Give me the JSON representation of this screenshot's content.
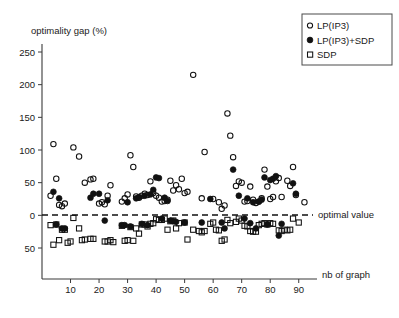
{
  "chart_data": {
    "type": "scatter",
    "title": "",
    "xlabel": "nb of graph",
    "ylabel": "optimality gap (%)",
    "xlim": [
      0,
      95
    ],
    "ylim": [
      -62,
      262
    ],
    "xticks": [
      10,
      20,
      30,
      40,
      50,
      60,
      70,
      80,
      90
    ],
    "xtick_labels": [
      "10",
      "20",
      "30",
      "40",
      "50",
      "60",
      "70",
      "80",
      "90"
    ],
    "yticks": [
      250,
      200,
      150,
      100,
      50,
      0,
      -50
    ],
    "ytick_labels": [
      "250",
      "200",
      "150",
      "100",
      "50",
      "0",
      "50"
    ],
    "grid": false,
    "legend_position": "top-right",
    "annotations": [
      {
        "name": "optimal-value",
        "text": "optimal value",
        "y": 0,
        "style": "dashed-horizontal-line"
      }
    ],
    "series": [
      {
        "name": "LP(IP3)",
        "marker": "open-circle",
        "color": "#111111",
        "points": [
          [
            3,
            30
          ],
          [
            4,
            109
          ],
          [
            5,
            56
          ],
          [
            6,
            16
          ],
          [
            7,
            14
          ],
          [
            8,
            18
          ],
          [
            11,
            104
          ],
          [
            13,
            90
          ],
          [
            15,
            50
          ],
          [
            17,
            55
          ],
          [
            18,
            56
          ],
          [
            20,
            18
          ],
          [
            21,
            20
          ],
          [
            22,
            17
          ],
          [
            23,
            30
          ],
          [
            24,
            46
          ],
          [
            28,
            21
          ],
          [
            29,
            26
          ],
          [
            30,
            32
          ],
          [
            31,
            92
          ],
          [
            32,
            74
          ],
          [
            33,
            29
          ],
          [
            34,
            27
          ],
          [
            35,
            30
          ],
          [
            36,
            33
          ],
          [
            37,
            31
          ],
          [
            38,
            52
          ],
          [
            39,
            34
          ],
          [
            40,
            30
          ],
          [
            41,
            27
          ],
          [
            42,
            21
          ],
          [
            43,
            22
          ],
          [
            44,
            24
          ],
          [
            45,
            53
          ],
          [
            46,
            38
          ],
          [
            47,
            46
          ],
          [
            48,
            40
          ],
          [
            49,
            56
          ],
          [
            50,
            34
          ],
          [
            51,
            36
          ],
          [
            53,
            215
          ],
          [
            56,
            26
          ],
          [
            57,
            97
          ],
          [
            60,
            25
          ],
          [
            62,
            20
          ],
          [
            63,
            10
          ],
          [
            64,
            15
          ],
          [
            65,
            156
          ],
          [
            66,
            122
          ],
          [
            67,
            89
          ],
          [
            68,
            45
          ],
          [
            69,
            52
          ],
          [
            70,
            50
          ],
          [
            71,
            21
          ],
          [
            72,
            22
          ],
          [
            73,
            44
          ],
          [
            74,
            24
          ],
          [
            75,
            19
          ],
          [
            76,
            21
          ],
          [
            77,
            26
          ],
          [
            78,
            70
          ],
          [
            79,
            44
          ],
          [
            80,
            25
          ],
          [
            81,
            28
          ],
          [
            82,
            52
          ],
          [
            83,
            57
          ],
          [
            84,
            28
          ],
          [
            86,
            53
          ],
          [
            87,
            45
          ],
          [
            88,
            74
          ],
          [
            89,
            31
          ],
          [
            92,
            20
          ]
        ]
      },
      {
        "name": "LP(IP3)+SDP",
        "marker": "filled-circle",
        "color": "#111111",
        "points": [
          [
            4,
            36
          ],
          [
            5,
            -14
          ],
          [
            6,
            26
          ],
          [
            7,
            -20
          ],
          [
            8,
            -20
          ],
          [
            17,
            27
          ],
          [
            18,
            33
          ],
          [
            20,
            33
          ],
          [
            22,
            -8
          ],
          [
            23,
            23
          ],
          [
            28,
            -15
          ],
          [
            29,
            -15
          ],
          [
            30,
            20
          ],
          [
            31,
            -17
          ],
          [
            33,
            26
          ],
          [
            34,
            28
          ],
          [
            35,
            -13
          ],
          [
            36,
            30
          ],
          [
            37,
            -15
          ],
          [
            38,
            32
          ],
          [
            39,
            39
          ],
          [
            40,
            58
          ],
          [
            41,
            57
          ],
          [
            42,
            -5
          ],
          [
            43,
            27
          ],
          [
            44,
            22
          ],
          [
            45,
            -8
          ],
          [
            46,
            -9
          ],
          [
            47,
            -10
          ],
          [
            50,
            -11
          ],
          [
            56,
            -11
          ],
          [
            59,
            25
          ],
          [
            63,
            -11
          ],
          [
            64,
            -20
          ],
          [
            67,
            70
          ],
          [
            69,
            30
          ],
          [
            71,
            -5
          ],
          [
            72,
            26
          ],
          [
            73,
            -12
          ],
          [
            74,
            20
          ],
          [
            75,
            -20
          ],
          [
            76,
            21
          ],
          [
            77,
            24
          ],
          [
            78,
            58
          ],
          [
            79,
            -14
          ],
          [
            80,
            54
          ],
          [
            81,
            56
          ],
          [
            82,
            60
          ],
          [
            83,
            -31
          ],
          [
            84,
            -13
          ],
          [
            88,
            49
          ],
          [
            89,
            33
          ]
        ]
      },
      {
        "name": "SDP",
        "marker": "open-square",
        "color": "#111111",
        "points": [
          [
            3,
            -15
          ],
          [
            4,
            -45
          ],
          [
            5,
            -14
          ],
          [
            6,
            -38
          ],
          [
            7,
            -22
          ],
          [
            8,
            -22
          ],
          [
            9,
            -42
          ],
          [
            10,
            -40
          ],
          [
            11,
            -4
          ],
          [
            13,
            -20
          ],
          [
            14,
            -38
          ],
          [
            15,
            -37
          ],
          [
            17,
            -36
          ],
          [
            18,
            -36
          ],
          [
            22,
            -40
          ],
          [
            23,
            -40
          ],
          [
            24,
            -38
          ],
          [
            25,
            -41
          ],
          [
            28,
            -16
          ],
          [
            29,
            -39
          ],
          [
            30,
            -38
          ],
          [
            31,
            -18
          ],
          [
            32,
            -39
          ],
          [
            33,
            -20
          ],
          [
            34,
            -28
          ],
          [
            35,
            -14
          ],
          [
            36,
            -14
          ],
          [
            37,
            -17
          ],
          [
            38,
            -13
          ],
          [
            39,
            -12
          ],
          [
            40,
            -6
          ],
          [
            41,
            -7
          ],
          [
            42,
            -7
          ],
          [
            43,
            -5
          ],
          [
            44,
            -22
          ],
          [
            45,
            -9
          ],
          [
            46,
            -8
          ],
          [
            47,
            -20
          ],
          [
            48,
            -12
          ],
          [
            50,
            -11
          ],
          [
            51,
            -37
          ],
          [
            53,
            -22
          ],
          [
            55,
            -24
          ],
          [
            56,
            -26
          ],
          [
            57,
            -24
          ],
          [
            59,
            -13
          ],
          [
            60,
            -11
          ],
          [
            61,
            -22
          ],
          [
            62,
            -23
          ],
          [
            63,
            -39
          ],
          [
            64,
            -37
          ],
          [
            65,
            -7
          ],
          [
            66,
            -12
          ],
          [
            68,
            -10
          ],
          [
            69,
            -5
          ],
          [
            70,
            -8
          ],
          [
            71,
            -16
          ],
          [
            72,
            -17
          ],
          [
            73,
            -24
          ],
          [
            74,
            -25
          ],
          [
            75,
            -25
          ],
          [
            76,
            -15
          ],
          [
            77,
            -13
          ],
          [
            78,
            -12
          ],
          [
            79,
            -14
          ],
          [
            80,
            -12
          ],
          [
            81,
            -13
          ],
          [
            83,
            -23
          ],
          [
            84,
            -24
          ],
          [
            85,
            -22
          ],
          [
            86,
            -23
          ],
          [
            87,
            -22
          ],
          [
            88,
            -5
          ],
          [
            90,
            -11
          ]
        ]
      }
    ]
  },
  "legend": {
    "entries": [
      {
        "label": "LP(IP3)",
        "marker": "open-circle"
      },
      {
        "label": "LP(IP3)+SDP",
        "marker": "filled-circle"
      },
      {
        "label": "SDP",
        "marker": "open-square"
      }
    ]
  },
  "axes": {
    "y_title": "optimality gap (%)",
    "x_title": "nb of graph"
  }
}
